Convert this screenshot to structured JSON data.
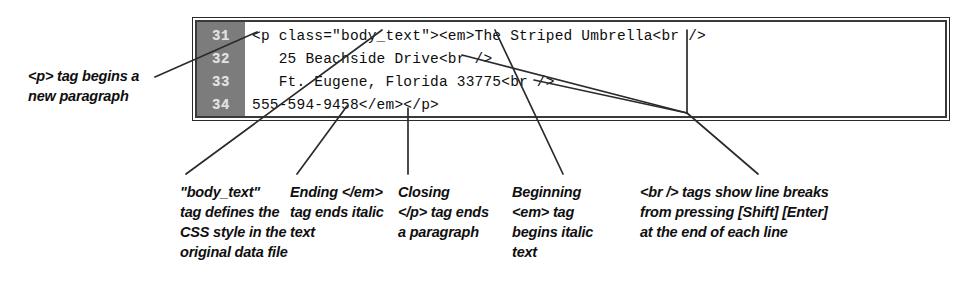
{
  "figure": {
    "kind": "annotated-code-listing",
    "colors": {
      "gutter_background": "#7c7c7c",
      "gutter_text": "#e2e2e2",
      "code_text": "#0d0d0d",
      "border": "#3a3a3a",
      "page_background": "#ffffff",
      "leader_line": "#2b2b2b"
    }
  },
  "code_listing": {
    "lines": [
      {
        "number": "31",
        "text": "<p class=\"body_text\"><em>The Striped Umbrella<br />"
      },
      {
        "number": "32",
        "text": "   25 Beachside Drive<br />"
      },
      {
        "number": "33",
        "text": "   Ft. Eugene, Florida 33775<br />"
      },
      {
        "number": "34",
        "text": "555-594-9458</em></p>"
      }
    ]
  },
  "annotations": {
    "p_tag": {
      "name": "p-tag-callout",
      "lines": [
        "<p> tag begins a",
        "new paragraph"
      ]
    },
    "body_text": {
      "name": "body-text-callout",
      "lines": [
        "\"body_text\"",
        "tag defines the",
        "CSS style in the",
        "original data file"
      ]
    },
    "ending_em": {
      "name": "ending-em-callout",
      "lines": [
        "Ending </em>",
        "tag ends italic",
        "text"
      ]
    },
    "closing_p": {
      "name": "closing-p-callout",
      "lines": [
        "Closing",
        "</p> tag ends",
        "a paragraph"
      ]
    },
    "beginning_em": {
      "name": "beginning-em-callout",
      "lines": [
        "Beginning",
        "<em> tag",
        "begins italic",
        "text"
      ]
    },
    "br_tags": {
      "name": "br-tags-callout",
      "lines": [
        "<br /> tags show line breaks",
        "from pressing [Shift] [Enter]",
        "at the end of each line"
      ]
    }
  }
}
